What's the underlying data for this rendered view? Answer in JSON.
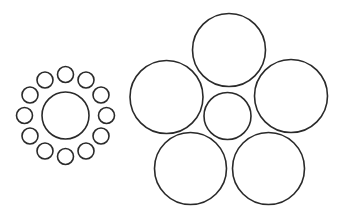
{
  "figure": {
    "name": "ebbinghaus-illusion",
    "width": 344,
    "height": 224,
    "background": "#ffffff",
    "stroke_color": "#2a2a2a",
    "stroke_width": 1.6
  },
  "left_group": {
    "center_circle": {
      "cx": 65.5,
      "cy": 115.5,
      "r": 23.5
    },
    "surround": {
      "count": 12,
      "ring_radius": 41,
      "circle_radius": 8,
      "start_angle_deg": -90
    }
  },
  "right_group": {
    "center_circle": {
      "cx": 227.5,
      "cy": 116,
      "r": 23.5
    },
    "surround_circles": [
      {
        "cx": 229,
        "cy": 50,
        "r": 36.5
      },
      {
        "cx": 291,
        "cy": 96,
        "r": 36.5
      },
      {
        "cx": 268.5,
        "cy": 168.5,
        "r": 36
      },
      {
        "cx": 190.5,
        "cy": 168.5,
        "r": 36
      },
      {
        "cx": 166.5,
        "cy": 97,
        "r": 36.5
      }
    ]
  }
}
